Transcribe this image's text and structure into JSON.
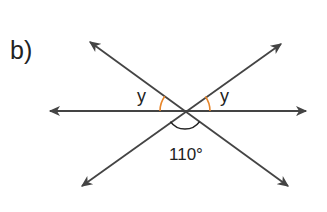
{
  "figure": {
    "part_label": "b)",
    "lines": [
      {
        "name": "horizontal-line",
        "from": [
          48,
          111
        ],
        "to": [
          308,
          111
        ],
        "arrows": "both"
      },
      {
        "name": "diagonal-line-descending",
        "from": [
          88,
          40
        ],
        "to": [
          290,
          188
        ],
        "arrows": "both"
      },
      {
        "name": "diagonal-line-ascending",
        "from": [
          80,
          188
        ],
        "to": [
          283,
          42
        ],
        "arrows": "both"
      }
    ],
    "intersection": [
      185,
      111
    ],
    "angles": [
      {
        "name": "angle-y-left",
        "label": "y",
        "color": "#e8862a"
      },
      {
        "name": "angle-y-right",
        "label": "y",
        "color": "#e8862a"
      },
      {
        "name": "angle-bottom",
        "label": "110°",
        "color": "#222222"
      }
    ],
    "line_color": "#444444"
  }
}
